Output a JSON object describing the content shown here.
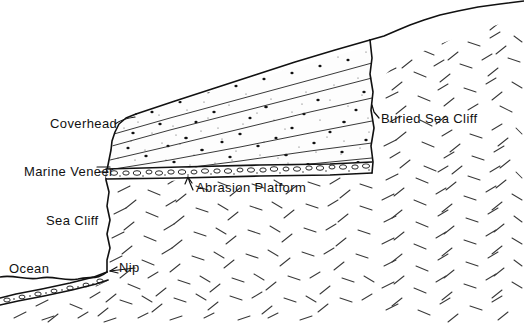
{
  "figure": {
    "type": "geologic-cross-section",
    "background_color": "#ffffff",
    "ink_color": "#111111",
    "width": 524,
    "height": 327
  },
  "labels": {
    "coverhead": "Coverhead",
    "marine_veneer": "Marine Veneer",
    "sea_cliff": "Sea Cliff",
    "ocean": "Ocean",
    "nip": "Nip",
    "abrasion_platform": "Abrasion Platform",
    "buried_sea_cliff": "Buried Sea Cliff"
  },
  "label_positions": {
    "coverhead": {
      "x": 50,
      "y": 128,
      "anchor": "start"
    },
    "marine_veneer": {
      "x": 24,
      "y": 176,
      "anchor": "start"
    },
    "sea_cliff": {
      "x": 46,
      "y": 225,
      "anchor": "start"
    },
    "ocean": {
      "x": 9,
      "y": 273,
      "anchor": "start"
    },
    "nip": {
      "x": 119,
      "y": 272,
      "anchor": "start"
    },
    "abrasion_platform": {
      "x": 196,
      "y": 192,
      "anchor": "start"
    },
    "buried_sea_cliff": {
      "x": 381,
      "y": 123,
      "anchor": "start"
    }
  },
  "units": [
    {
      "name": "coverhead",
      "description": "Stratified stipple-patterned cover deposits overlying the abrasion platform, thickening and rising to the right",
      "pattern": "stippled-strata",
      "strata_count": 6
    },
    {
      "name": "marine-veneer",
      "description": "Thin pebble-and-cobble lag veneer directly above the abrasion platform, continuing seaward beneath the ocean",
      "pattern": "pebble-lag"
    },
    {
      "name": "abrasion-platform",
      "description": "Wave-cut bedrock surface at the base of the cover deposits",
      "pattern": "surface-line"
    },
    {
      "name": "bedrock",
      "description": "Crystalline bedrock shown with randomly oriented short dash hatching",
      "pattern": "random-dash-hatch"
    },
    {
      "name": "ocean",
      "description": "Sea surface at left with wavy water line",
      "pattern": "wavy-water-line"
    }
  ],
  "features": {
    "nip": "Notch at the base of the active sea cliff where the shoreline meets bedrock",
    "buried_sea_cliff": "Former, now-buried cliff face at the landward edge of the abrasion platform"
  }
}
